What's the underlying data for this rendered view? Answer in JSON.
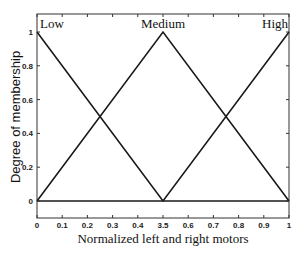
{
  "chart_data": {
    "type": "line",
    "title": "",
    "xlabel": "Normalized left and right motors",
    "ylabel": "Degree of membership",
    "xlim": [
      0,
      1
    ],
    "ylim": [
      -0.1,
      1.1
    ],
    "grid": false,
    "legend": null,
    "x_ticks": [
      "0",
      "0.1",
      "0.2",
      "0.3",
      "0.4",
      "3.5",
      "0.6",
      "0.7",
      "0.8",
      "0.9",
      "1"
    ],
    "x_tick_values": [
      0,
      0.1,
      0.2,
      0.3,
      0.4,
      0.5,
      0.6,
      0.7,
      0.8,
      0.9,
      1
    ],
    "y_ticks": [
      "0",
      "0.2",
      "0.4",
      "0.6",
      "0.8",
      "1"
    ],
    "y_tick_values": [
      0,
      0.2,
      0.4,
      0.6,
      0.8,
      1
    ],
    "series": [
      {
        "name": "Low",
        "x": [
          0,
          0.5,
          1
        ],
        "y": [
          1,
          0,
          0
        ]
      },
      {
        "name": "Medium",
        "x": [
          0,
          0.5,
          1
        ],
        "y": [
          0,
          1,
          0
        ]
      },
      {
        "name": "High",
        "x": [
          0,
          0.5,
          1
        ],
        "y": [
          0,
          0,
          1
        ]
      }
    ],
    "annotations": [
      {
        "text": "Low",
        "x": 0,
        "y": 1
      },
      {
        "text": "Medium",
        "x": 0.5,
        "y": 1
      },
      {
        "text": "High",
        "x": 1,
        "y": 1
      }
    ]
  },
  "colors": {
    "line": "#1a1a1a",
    "axes": "#333333",
    "background": "#ffffff"
  }
}
